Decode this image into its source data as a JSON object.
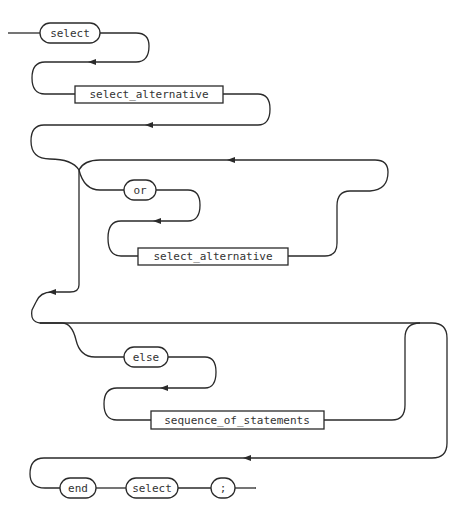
{
  "diagram": {
    "type": "syntax-diagram",
    "nodes": {
      "select_kw": "select",
      "select_alt_1": "select_alternative",
      "or_kw": "or",
      "select_alt_2": "select_alternative",
      "else_kw": "else",
      "seq_stmts": "sequence_of_statements",
      "end_kw": "end",
      "select_kw_2": "select",
      "semicolon": ";"
    },
    "colors": {
      "stroke": "#2a2a2a",
      "background": "#ffffff",
      "text": "#333333"
    }
  }
}
